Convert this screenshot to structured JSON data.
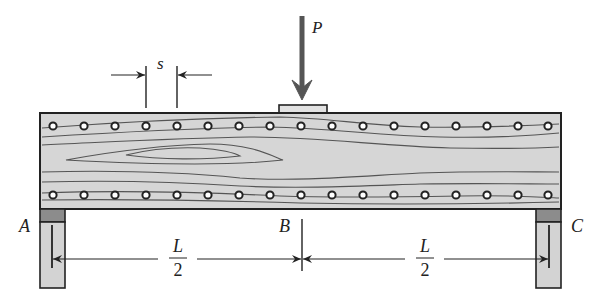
{
  "diagram": {
    "type": "simply-supported bolted composite wood beam with midspan point load",
    "load": {
      "label": "P"
    },
    "spacing": {
      "label": "s"
    },
    "supports": [
      {
        "id": "A",
        "label": "A"
      },
      {
        "id": "C",
        "label": "C"
      }
    ],
    "midpoint": {
      "label": "B"
    },
    "spans": [
      {
        "numerator": "L",
        "denominator": "2"
      },
      {
        "numerator": "L",
        "denominator": "2"
      }
    ],
    "bolts": {
      "rows": 2,
      "per_row": 17
    },
    "colors": {
      "beam_fill": "#d6d6d6",
      "outline": "#222222",
      "grain": "#555555",
      "support_fill": "#d3d3d3",
      "bearing_pad": "#8c8c8c",
      "arrow": "#555555"
    }
  }
}
